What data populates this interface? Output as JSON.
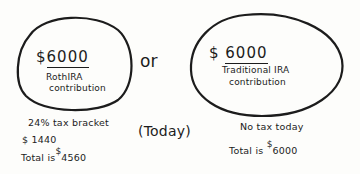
{
  "diagram": {
    "connector_word": "or",
    "time_label": "(Today)",
    "options": [
      {
        "id": "roth",
        "currency_symbol": "$",
        "amount": "6000",
        "label_line1": "RothIRA",
        "label_line2": "contribution",
        "notes": {
          "line1": "24% tax bracket",
          "line2": "$ 1440",
          "total_prefix": "Total is",
          "total_currency": "$",
          "total_value": "4560"
        }
      },
      {
        "id": "traditional",
        "currency_symbol": "$",
        "amount": "6000",
        "label_line1": "Traditional IRA",
        "label_line2": "contribution",
        "notes": {
          "line1": "No tax today",
          "total_prefix": "Total is",
          "total_currency": "$",
          "total_value": "6000"
        }
      }
    ]
  },
  "colors": {
    "ink": "#1c1c1c",
    "paper": "#fdfdfb"
  }
}
